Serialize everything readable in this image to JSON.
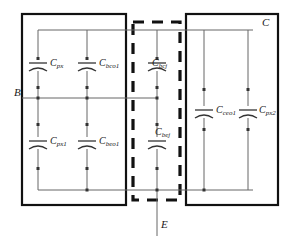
{
  "diagram": {
    "type": "circuit-schematic",
    "terminals": [
      {
        "name": "base-terminal",
        "label": "B",
        "x": 14,
        "y": 88
      },
      {
        "name": "collector-terminal",
        "label": "C",
        "x": 262,
        "y": 18
      },
      {
        "name": "emitter-terminal",
        "label": "E",
        "x": 159,
        "y": 222
      }
    ],
    "boxes": [
      {
        "name": "left-extrinsic-box",
        "style": "solid",
        "x": 22,
        "y": 14,
        "w": 104,
        "h": 191
      },
      {
        "name": "intrinsic-dashed-box",
        "style": "dashed",
        "x": 133,
        "y": 22,
        "w": 47,
        "h": 178
      },
      {
        "name": "right-extrinsic-box",
        "style": "solid",
        "x": 186,
        "y": 14,
        "w": 92,
        "h": 191
      }
    ],
    "rails": {
      "top": {
        "name": "collector-rail",
        "y": 30,
        "x1": 38,
        "x2": 253
      },
      "base": {
        "name": "base-rail",
        "y": 98,
        "x1": 22,
        "x2": 157
      },
      "bottom": {
        "name": "emitter-rail",
        "y": 190,
        "x1": 38,
        "x2": 253
      }
    },
    "capacitors": [
      {
        "name": "cap-cpx",
        "base": "C",
        "sub": "px",
        "x": 38,
        "y_top": 30,
        "y_bot": 98,
        "region": "left-upper"
      },
      {
        "name": "cap-cbco1",
        "base": "C",
        "sub": "bco1",
        "x": 87,
        "y_top": 30,
        "y_bot": 98,
        "region": "left-upper"
      },
      {
        "name": "cap-cpx1",
        "base": "C",
        "sub": "px1",
        "x": 38,
        "y_top": 98,
        "y_bot": 190,
        "region": "left-lower"
      },
      {
        "name": "cap-cbeo1",
        "base": "C",
        "sub": "beo1",
        "x": 87,
        "y_top": 98,
        "y_bot": 190,
        "region": "left-lower"
      },
      {
        "name": "cap-cbcj",
        "base": "C",
        "sub": "bcj",
        "x": 157,
        "y_top": 30,
        "y_bot": 98,
        "region": "intrinsic-upper"
      },
      {
        "name": "cap-cbej",
        "base": "C",
        "sub": "bej",
        "x": 157,
        "y_top": 98,
        "y_bot": 190,
        "region": "intrinsic-lower"
      },
      {
        "name": "cap-cceo1",
        "base": "C",
        "sub": "ceo1",
        "x": 204,
        "y_top": 30,
        "y_bot": 190,
        "region": "right"
      },
      {
        "name": "cap-cpx2",
        "base": "C",
        "sub": "px2",
        "x": 248,
        "y_top": 30,
        "y_bot": 190,
        "region": "right"
      }
    ],
    "colors": {
      "box_stroke": "#111111",
      "wire_stroke": "#555555",
      "node_fill": "#333333",
      "text": "#1a1a1a",
      "background": "#ffffff"
    }
  }
}
